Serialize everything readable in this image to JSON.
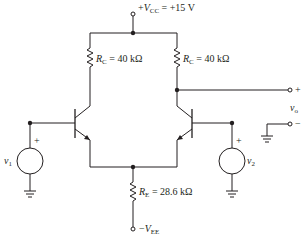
{
  "diagram": {
    "type": "differential-pair-bjt-circuit",
    "supply": {
      "symbol": "V",
      "sub": "CC",
      "prefix": "+",
      "value": "= +15 V"
    },
    "negative_supply": {
      "symbol": "V",
      "sub": "EE",
      "prefix": "−"
    },
    "resistors": [
      {
        "id": "rc-left",
        "symbol": "R",
        "sub": "C",
        "value": "= 40 kΩ"
      },
      {
        "id": "rc-right",
        "symbol": "R",
        "sub": "C",
        "value": "= 40 kΩ"
      },
      {
        "id": "re",
        "symbol": "R",
        "sub": "E",
        "value": "= 28.6 kΩ"
      }
    ],
    "sources": [
      {
        "id": "v1",
        "symbol": "v",
        "sub": "1",
        "polarity": "+"
      },
      {
        "id": "v2",
        "symbol": "v",
        "sub": "2",
        "polarity": "+"
      }
    ],
    "output": {
      "symbol": "v",
      "sub": "o",
      "plus": "+",
      "minus": "−"
    },
    "stroke_color": "#231f20"
  }
}
